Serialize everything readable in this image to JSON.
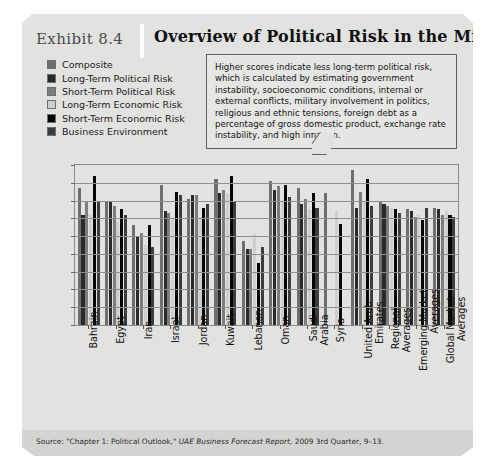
{
  "exhibit": {
    "number": "Exhibit 8.4",
    "title": "Overview of Political Risk in the Middle East",
    "callout": "Higher scores indicate less long-term political risk, which is calculated by estimating government instability, socioeconomic conditions, internal or external conflicts, military involvement in politics, religious and ethnic tensions, foreign debt as a percentage of gross domestic product, exchange rate instability, and high inflation.",
    "source_prefix": "Source: \"Chapter 1: Political Outlook,\" ",
    "source_italic": "UAE Business Forecast Report,",
    "source_suffix": " 2009 3rd Quarter, 9–13."
  },
  "colors": {
    "panel": "#e2e2e0",
    "source_bar": "#d3d3d1",
    "axis": "#8a8a8a",
    "grid": "#8e8e8e",
    "series": [
      "#6e6e6e",
      "#2a2a2a",
      "#7d7d7d",
      "#cfcfcd",
      "#050505",
      "#3d3d3d"
    ]
  },
  "chart_data": {
    "type": "bar",
    "title": "Overview of Political Risk in the Middle East",
    "xlabel": "",
    "ylabel": "",
    "ylim": [
      0,
      90
    ],
    "yticks": [
      0,
      10,
      20,
      30,
      40,
      50,
      60,
      70,
      80,
      90
    ],
    "grid": true,
    "legend_position": "top-left",
    "categories": [
      "Bahrain",
      "Egypt",
      "Iran",
      "Israel",
      "Jordan",
      "Kuwait",
      "Lebanon",
      "Oman",
      "Saudi Arabia",
      "Syria",
      "United Arab Emirates",
      "Regional Averages",
      "Emerging Market Averages",
      "Global Market Averages"
    ],
    "series": [
      {
        "name": "Composite",
        "color": "#6e6e6e",
        "values": [
          77,
          69,
          56,
          79,
          71,
          82,
          47,
          81,
          77,
          74,
          87,
          69,
          65,
          66
        ]
      },
      {
        "name": "Long-Term Political Risk",
        "color": "#2a2a2a",
        "values": [
          62,
          69,
          50,
          64,
          73,
          74,
          43,
          76,
          68,
          null,
          66,
          68,
          64,
          65
        ]
      },
      {
        "name": "Short-Term Political Risk",
        "color": "#7d7d7d",
        "values": [
          69,
          67,
          52,
          63,
          73,
          76,
          43,
          78,
          71,
          null,
          75,
          67,
          61,
          62
        ]
      },
      {
        "name": "Long-Term Economic Risk",
        "color": "#cfcfcd",
        "values": [
          62,
          58,
          45,
          61,
          61,
          74,
          51,
          70,
          65,
          64,
          69,
          66,
          62,
          64
        ]
      },
      {
        "name": "Short-Term Economic Risk",
        "color": "#050505",
        "values": [
          84,
          65,
          56,
          75,
          66,
          84,
          35,
          79,
          74,
          57,
          82,
          65,
          59,
          62
        ]
      },
      {
        "name": "Business Environment",
        "color": "#3d3d3d",
        "values": [
          69,
          62,
          44,
          73,
          68,
          70,
          44,
          72,
          66,
          null,
          67,
          63,
          66,
          61
        ]
      }
    ]
  }
}
